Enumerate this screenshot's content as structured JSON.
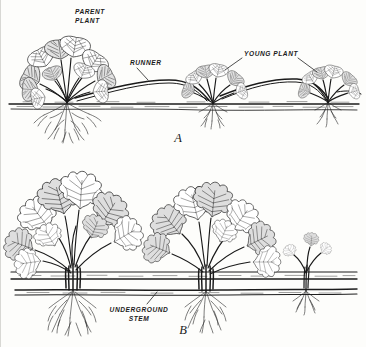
{
  "figure": {
    "background_color": "#fdfdfb",
    "ink_color": "#1d1d1d"
  },
  "panels": [
    {
      "id": "A",
      "letter": "A",
      "subject": "strawberry-runner-propagation",
      "ground_line_y": 104,
      "labels": [
        {
          "name": "parent-plant",
          "line1": "PARENT",
          "line2": "PLANT",
          "x": 74,
          "y": 14
        },
        {
          "name": "runner",
          "line1": "RUNNER",
          "line2": "",
          "x": 129,
          "y": 65
        },
        {
          "name": "young-plant",
          "line1": "YOUNG PLANT",
          "line2": "",
          "x": 243,
          "y": 56
        }
      ],
      "plants": [
        {
          "name": "parent-plant-strawberry",
          "x": 66,
          "scale": 1.0
        },
        {
          "name": "young-plant-middle",
          "x": 212,
          "scale": 0.62
        },
        {
          "name": "young-plant-right",
          "x": 327,
          "scale": 0.58
        }
      ]
    },
    {
      "id": "B",
      "letter": "B",
      "subject": "rhizome-underground-stem-propagation",
      "ground_line_y": 276,
      "underground_stem_y": 289,
      "labels": [
        {
          "name": "underground-stem",
          "line1": "UNDERGROUND",
          "line2": "STEM",
          "x": 138,
          "y": 312
        }
      ],
      "plants": [
        {
          "name": "rhizome-plant-left",
          "x": 72,
          "scale": 1.0
        },
        {
          "name": "rhizome-plant-middle",
          "x": 205,
          "scale": 0.92
        },
        {
          "name": "rhizome-shoot-right",
          "x": 305,
          "scale": 0.34
        }
      ]
    }
  ]
}
